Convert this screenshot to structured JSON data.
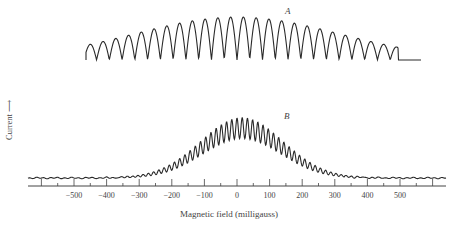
{
  "chart_data": {
    "type": "line",
    "title": "",
    "xlabel": "Magnetic field (milligauss)",
    "ylabel": "Current",
    "xlim": [
      -630,
      630
    ],
    "x_ticks": [
      -500,
      -400,
      -300,
      -200,
      -100,
      0,
      100,
      200,
      300,
      400,
      500
    ],
    "x_tick_labels": [
      "−500",
      "−400",
      "−300",
      "−200",
      "−100",
      "0",
      "100",
      "200",
      "300",
      "400",
      "500"
    ],
    "grid": false,
    "legend": null,
    "series": [
      {
        "name": "A",
        "description": "Interference pattern with deep modulation; ~24 arches between about -470 and +470 mG, envelope maximum near 0 mG",
        "approx_x_range": [
          -470,
          470
        ],
        "num_fringes": 24,
        "envelope_peak_x": 0,
        "modulation_depth": "full (minima return to baseline)"
      },
      {
        "name": "B",
        "description": "Interference pattern with partial modulation on a broad bell-shaped background; oscillations visible from about -320 to +320 mG, maximum near 0 mG",
        "approx_x_range": [
          -320,
          320
        ],
        "num_fringes": 40,
        "envelope_peak_x": 20,
        "modulation_depth": "partial"
      }
    ],
    "annotations": [
      "A",
      "B"
    ]
  },
  "labels": {
    "curve_a": "A",
    "curve_b": "B",
    "xlabel": "Magnetic field (milligauss)",
    "ylabel": "Current ⟶",
    "ticks": [
      "−500",
      "−400",
      "−300",
      "−200",
      "−100",
      "0",
      "100",
      "200",
      "300",
      "400",
      "500"
    ]
  },
  "colors": {
    "line": "#2a2a2a",
    "axis": "#444444",
    "text": "#444444"
  }
}
